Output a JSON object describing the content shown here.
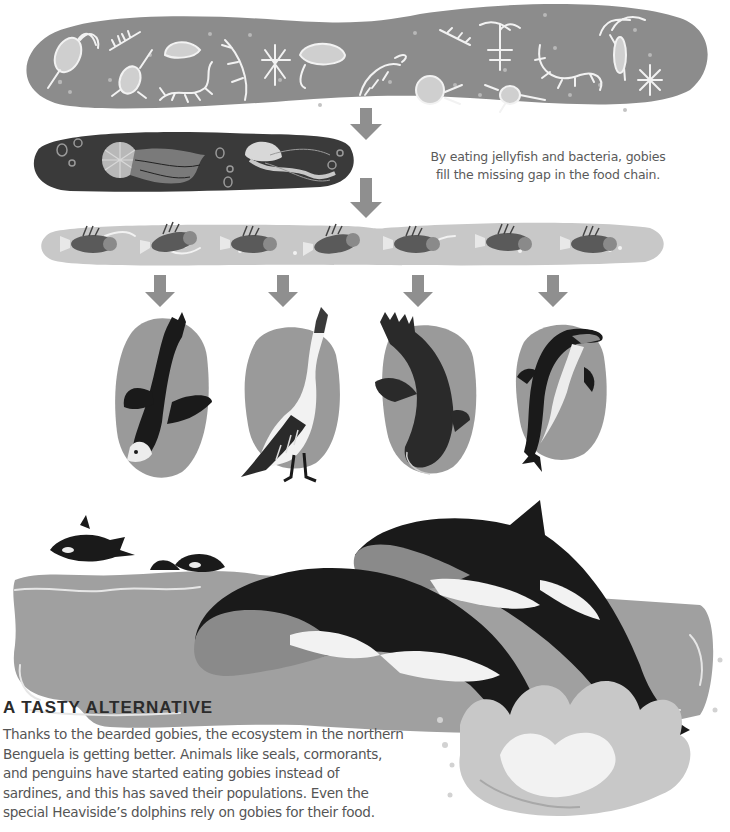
{
  "illustration": {
    "tiers": [
      {
        "id": "plankton",
        "label": "Plankton band",
        "color": "#8c8c8c",
        "organism_count": 20
      },
      {
        "id": "jellyfish",
        "label": "Jellyfish and bacteria band",
        "color": "#3a3a3a",
        "organism_count": 2
      },
      {
        "id": "gobies",
        "label": "Bearded gobies band",
        "color": "#c8c8c8",
        "organism_count": 7
      },
      {
        "id": "predators",
        "label": "Predators",
        "items": [
          "penguin",
          "cormorant",
          "seal",
          "heavisides-dolphin"
        ],
        "color": "#9a9a9a"
      },
      {
        "id": "orcas",
        "label": "Orcas leaping",
        "color": "#a0a0a0"
      }
    ],
    "arrow_color": "#8f8f8f"
  },
  "caption": {
    "line1": "By eating jellyfish and bacteria, gobies",
    "line2": "fill the missing gap in the food chain."
  },
  "section": {
    "heading": "A TASTY ALTERNATIVE",
    "lines": [
      "Thanks to the bearded gobies, the ecosystem in the northern",
      "Benguela is getting better. Animals like seals, cormorants,",
      "and penguins have started eating gobies instead of",
      "sardines, and this has saved their populations. Even the",
      "special Heaviside’s dolphins rely on gobies for their food."
    ]
  }
}
